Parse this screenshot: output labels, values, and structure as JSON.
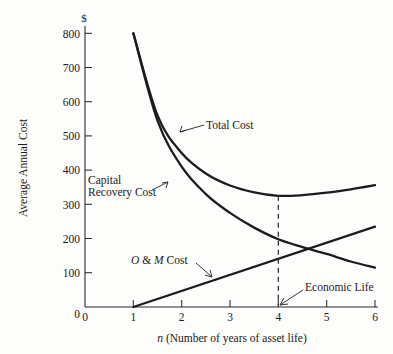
{
  "figure": {
    "name": "average-annual-cost-vs-asset-life",
    "background_color": "#fdfdfc",
    "ink_color": "#1c1c1c"
  },
  "axes": {
    "y_title": "Average Annual Cost",
    "y_unit": "$",
    "x_title_italic": "n",
    "x_title_rest": " (Number of years of asset life)",
    "x_title_full": "n (Number of years of asset life)",
    "y_ticks": [
      "0",
      "100",
      "200",
      "300",
      "400",
      "500",
      "600",
      "700",
      "800"
    ],
    "x_ticks": [
      "0",
      "1",
      "2",
      "3",
      "4",
      "5",
      "6"
    ]
  },
  "labels": {
    "total_cost": "Total Cost",
    "capital_recovery_line1": "Capital",
    "capital_recovery_line2": "Recovery Cost",
    "om_cost_italic_o": "O",
    "om_cost_amp": " & ",
    "om_cost_italic_m": "M",
    "om_cost_rest": " Cost",
    "om_cost_full": "O & M Cost",
    "economic_life": "Economic Life"
  },
  "chart_data": {
    "type": "line",
    "title": "",
    "xlabel": "n (Number of years of asset life)",
    "ylabel": "Average Annual Cost",
    "yunit": "$",
    "xlim": [
      0,
      6
    ],
    "ylim": [
      0,
      800
    ],
    "xticks": [
      0,
      1,
      2,
      3,
      4,
      5,
      6
    ],
    "yticks": [
      0,
      100,
      200,
      300,
      400,
      500,
      600,
      700,
      800
    ],
    "grid": false,
    "legend": "none",
    "x": [
      1,
      1.5,
      2,
      2.5,
      3,
      3.5,
      4,
      4.5,
      5,
      5.5,
      6
    ],
    "series": [
      {
        "name": "Total Cost",
        "values": [
          800,
          560,
          450,
          390,
          355,
          335,
          325,
          327,
          334,
          344,
          356
        ]
      },
      {
        "name": "Capital Recovery Cost",
        "values": [
          800,
          545,
          410,
          330,
          275,
          232,
          198,
          175,
          155,
          133,
          115
        ]
      },
      {
        "name": "O & M Cost",
        "values": [
          0,
          24,
          47,
          71,
          94,
          118,
          141,
          165,
          188,
          212,
          235
        ]
      }
    ],
    "annotations": [
      {
        "name": "economic-life",
        "text": "Economic Life",
        "x": 4,
        "y": 0,
        "note": "dashed vertical reference line at n = 4 from total-cost minimum down to x axis"
      }
    ],
    "economic_life_n": 4,
    "total_cost_minimum": 325
  }
}
